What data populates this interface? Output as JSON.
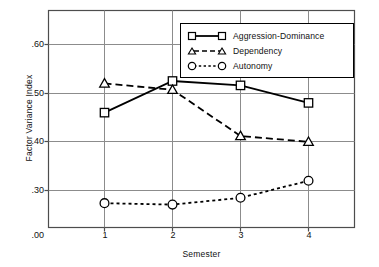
{
  "chart_data": {
    "type": "line",
    "title": "",
    "xlabel": "Semester",
    "ylabel": "Factor Variance Index",
    "categories": [
      "1",
      "2",
      "3",
      "4"
    ],
    "x": [
      1,
      2,
      3,
      4
    ],
    "xlim": [
      0.5,
      4.6
    ],
    "ylim": [
      0.0,
      0.655
    ],
    "y_tick_labels": [
      ".00",
      ".30",
      ".40",
      ".50",
      ".60"
    ],
    "y_tick_values": [
      0.0,
      0.3,
      0.4,
      0.5,
      0.6
    ],
    "x_tick_labels": [
      "1",
      "2",
      "3",
      "4"
    ],
    "grid": "both",
    "axis_note": "broken y-axis: .00 at baseline, linear from .30 upward",
    "legend_position": "top-right-inside",
    "series": [
      {
        "name": "Aggression-Dominance",
        "marker": "square",
        "line_style": "solid",
        "values": [
          0.46,
          0.525,
          0.516,
          0.48
        ]
      },
      {
        "name": "Dependency",
        "marker": "triangle",
        "line_style": "dashed",
        "values": [
          0.52,
          0.507,
          0.412,
          0.4
        ]
      },
      {
        "name": "Autonomy",
        "marker": "circle",
        "line_style": "dotted",
        "values": [
          0.274,
          0.271,
          0.285,
          0.32
        ]
      }
    ],
    "colors": {
      "line": "#000000",
      "grid": "#8c8c8c",
      "frame": "#4d4d4d",
      "background": "#ffffff"
    }
  },
  "legend": {
    "items": [
      {
        "label": "Aggression-Dominance"
      },
      {
        "label": "Dependency"
      },
      {
        "label": "Autonomy"
      }
    ]
  },
  "axes": {
    "y_title": "Factor Variance Index",
    "x_title": "Semester",
    "y_labels": [
      ".60",
      ".50",
      ".40",
      ".30",
      ".00"
    ],
    "x_labels": [
      "1",
      "2",
      "3",
      "4"
    ]
  }
}
